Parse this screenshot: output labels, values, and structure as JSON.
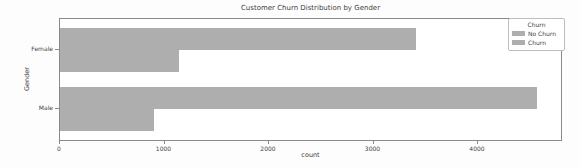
{
  "colors": {
    "bar": "#aeaeae",
    "spine": "#8a8a8a",
    "text": "#3f3f3f",
    "legend_border": "#bdbdbd",
    "background": "#fdfdfd"
  },
  "chart_data": {
    "type": "bar",
    "orientation": "horizontal",
    "title": "Customer Churn Distribution by Gender",
    "categories": [
      "Female",
      "Male"
    ],
    "series": [
      {
        "name": "No Churn",
        "values": [
          3404,
          4559
        ]
      },
      {
        "name": "Churn",
        "values": [
          1139,
          898
        ]
      }
    ],
    "xlabel": "count",
    "ylabel": "Gender",
    "xlim": [
      0,
      4813
    ],
    "xticks": [
      0,
      1000,
      2000,
      3000,
      4000
    ],
    "grid": false,
    "legend": {
      "title": "Churn",
      "entries": [
        "No Churn",
        "Churn"
      ],
      "position": "upper right"
    }
  }
}
